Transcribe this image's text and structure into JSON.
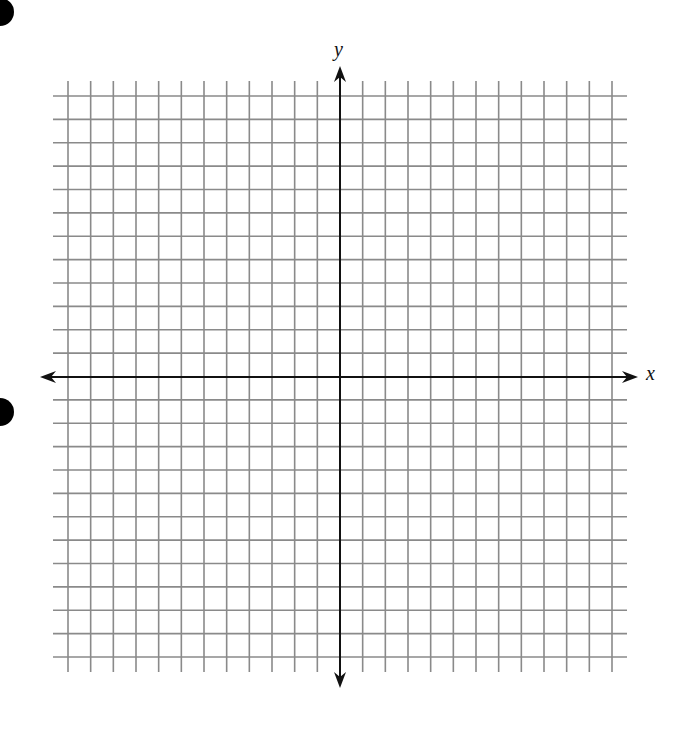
{
  "diagram": {
    "type": "coordinate-grid",
    "x_axis_label": "x",
    "y_axis_label": "y",
    "grid": {
      "units_each_direction": 12,
      "x_lines": 25,
      "y_lines": 25,
      "x_start_px": 68,
      "x_end_px": 612,
      "y_start_px": 96,
      "y_end_px": 657,
      "line_overhang_px": 15,
      "origin_px": [
        340,
        377
      ]
    },
    "colors": {
      "grid_line": "#8a8a8a",
      "axis": "#111111",
      "bullet": "#000000",
      "background": "#ffffff"
    },
    "bullets": [
      {
        "x": 0,
        "y": 12,
        "r": 14
      },
      {
        "x": 0,
        "y": 412,
        "r": 14
      }
    ]
  }
}
